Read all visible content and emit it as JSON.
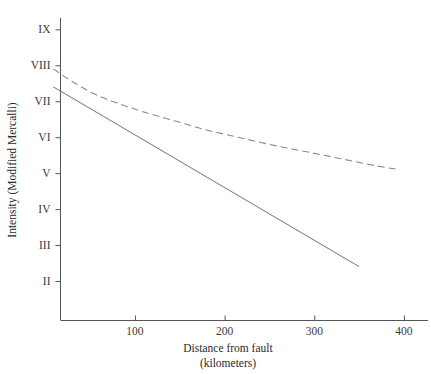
{
  "chart_data": {
    "type": "line",
    "title": "",
    "xlabel": "Distance from fault",
    "xlabel_sub": "(kilometers)",
    "ylabel": "Intensity (Modified Mercalli)",
    "xlim": [
      17,
      430
    ],
    "ylim": [
      1.0,
      9.6
    ],
    "grid": false,
    "legend": "none",
    "x_ticks": [
      100,
      200,
      300,
      400
    ],
    "x_tick_labels": [
      "100",
      "200",
      "300",
      "400"
    ],
    "y_ticks": [
      2,
      3,
      4,
      5,
      6,
      7,
      8,
      9
    ],
    "y_tick_labels": [
      "II",
      "III",
      "IV",
      "V",
      "VI",
      "VII",
      "VIII",
      "IX"
    ],
    "series": [
      {
        "name": "attenuation-curve-dashed",
        "style": "dashed",
        "color": "#8a8a8a",
        "x": [
          9,
          30,
          55,
          80,
          110,
          145,
          180,
          215,
          250,
          290,
          330,
          370,
          395
        ],
        "values": [
          7.9,
          7.55,
          7.2,
          6.95,
          6.7,
          6.45,
          6.2,
          6.0,
          5.8,
          5.6,
          5.4,
          5.2,
          5.1
        ]
      },
      {
        "name": "attenuation-line-solid",
        "style": "solid",
        "color": "#7a7a7a",
        "x": [
          9,
          350
        ],
        "values": [
          7.4,
          2.4
        ]
      }
    ]
  },
  "axes": {
    "x_title_line1": "Distance from fault",
    "x_title_line2": "(kilometers)",
    "y_title": "Intensity (Modified Mercalli)"
  },
  "colors": {
    "axis": "#555555",
    "text": "#2a2a2a",
    "solid_series": "#7a7a7a",
    "dashed_series": "#8a8a8a",
    "background": "#ffffff"
  }
}
